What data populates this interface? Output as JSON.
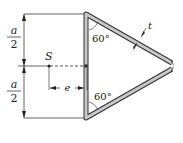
{
  "diagram": {
    "labels": {
      "half_height_top_num": "a",
      "half_height_top_den": "2",
      "half_height_bot_num": "a",
      "half_height_bot_den": "2",
      "shear_center": "S",
      "eccentricity": "e",
      "thickness": "t",
      "angle_top": "60°",
      "angle_bottom": "60°"
    },
    "colors": {
      "wall_fill": "#c8c8c8",
      "wall_stroke": "#333333",
      "line": "#222222"
    }
  }
}
